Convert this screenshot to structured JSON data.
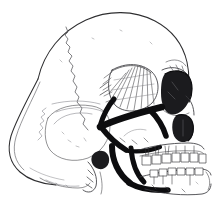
{
  "image": {
    "title": "Human Skull — Lateral (Left Side) View",
    "medium": "pen-and-ink line drawing with cross-hatching",
    "orientation": "facing right",
    "background_color": "#ffffff",
    "ink_color": "#0d0d0f",
    "outline_color": "#2e2e30",
    "hatch_color": "#3c3c40",
    "width_px": 217,
    "height_px": 212
  },
  "regions": {
    "cranial_vault": {
      "name": "Cranial vault (frontal + parietal)",
      "style": "thin continuous contour, largely unshaded white",
      "tone": "light"
    },
    "coronal_suture": {
      "name": "Coronal suture",
      "style": "fine zigzag / serrated line descending from vertex",
      "tone": "faint grey"
    },
    "occiput": {
      "name": "Occipital bone",
      "style": "thin contour sweeping left and down",
      "tone": "light"
    },
    "temporal_fossa": {
      "name": "Temporal fossa and squamous temporal",
      "style": "dense radiating cross-hatching fan",
      "tone": "mid-dark"
    },
    "zygomatic_arch": {
      "name": "Zygomatic arch",
      "style": "bold solid black band, strongest contrast element",
      "tone": "black"
    },
    "orbit": {
      "name": "Orbital cavity",
      "style": "deeply shaded hollow with heavy black interior",
      "tone": "black"
    },
    "nasal_aperture": {
      "name": "Nasal aperture (piriform)",
      "style": "dark pear-shaped void beside nasal bones",
      "tone": "dark"
    },
    "maxilla": {
      "name": "Maxilla with upper dentition",
      "style": "outlined tooth crowns with root shading",
      "tone": "light with dark interdental marks"
    },
    "mandible": {
      "name": "Mandible — ramus, angle and body",
      "style": "bold black ramus, lighter body with lower dentition",
      "tone": "black to mid"
    },
    "mastoid": {
      "name": "Mastoid process",
      "style": "small shaded conical projection below ear region",
      "tone": "mid-dark"
    }
  },
  "features_visible": [
    "cranial vault",
    "coronal suture",
    "occipital bone",
    "temporal fossa hatching",
    "zygomatic arch",
    "orbital cavity",
    "nasal aperture",
    "maxillary teeth",
    "mandibular teeth",
    "mandibular ramus",
    "mandibular angle",
    "mastoid process",
    "external auditory meatus"
  ]
}
